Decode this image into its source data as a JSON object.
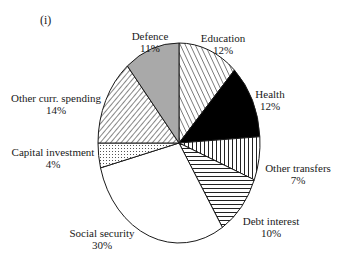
{
  "chart_data": {
    "type": "pie",
    "title": "",
    "panel_label": "(i)",
    "categories": [
      "Defence",
      "Education",
      "Health",
      "Other transfers",
      "Debt interest",
      "Social security",
      "Capital investment",
      "Other curr. spending"
    ],
    "values": [
      11,
      12,
      12,
      7,
      10,
      30,
      4,
      14
    ],
    "unit": "%",
    "slices": [
      {
        "label": "Defence",
        "value": 11,
        "value_label": "11%",
        "fill": "solid-gray",
        "color": "#a9a9a9"
      },
      {
        "label": "Education",
        "value": 12,
        "value_label": "12%",
        "fill": "diagonal-hatch-backslash",
        "color": "#ffffff"
      },
      {
        "label": "Health",
        "value": 12,
        "value_label": "12%",
        "fill": "solid-black",
        "color": "#000000"
      },
      {
        "label": "Other transfers",
        "value": 7,
        "value_label": "7%",
        "fill": "vertical-lines",
        "color": "#ffffff"
      },
      {
        "label": "Debt interest",
        "value": 10,
        "value_label": "10%",
        "fill": "horizontal-lines",
        "color": "#ffffff"
      },
      {
        "label": "Social security",
        "value": 30,
        "value_label": "30%",
        "fill": "none",
        "color": "#ffffff"
      },
      {
        "label": "Capital investment",
        "value": 4,
        "value_label": "4%",
        "fill": "dots",
        "color": "#ffffff"
      },
      {
        "label": "Other curr. spending",
        "value": 14,
        "value_label": "14%",
        "fill": "diagonal-hatch-slash",
        "color": "#ffffff"
      }
    ],
    "legend": "none (labels placed around pie)"
  },
  "labels": {
    "panel": "(i)",
    "defence": {
      "name": "Defence",
      "pct": "11%"
    },
    "education": {
      "name": "Education",
      "pct": "12%"
    },
    "health": {
      "name": "Health",
      "pct": "12%"
    },
    "other_transfers": {
      "name": "Other transfers",
      "pct": "7%"
    },
    "debt_interest": {
      "name": "Debt interest",
      "pct": "10%"
    },
    "social_security": {
      "name": "Social security",
      "pct": "30%"
    },
    "capital_investment": {
      "name": "Capital investment",
      "pct": "4%"
    },
    "other_curr": {
      "name": "Other curr. spending",
      "pct": "14%"
    }
  },
  "colors": {
    "outline": "#1a1a1a",
    "defence_gray": "#a9a9a9",
    "health_black": "#000000",
    "background": "#ffffff"
  }
}
